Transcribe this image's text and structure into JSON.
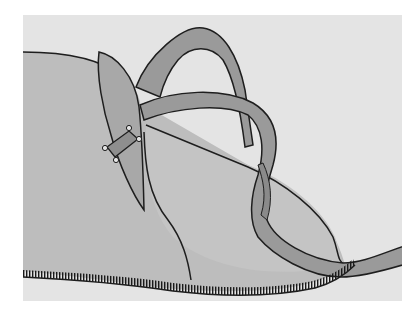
{
  "figure": {
    "colors": {
      "page_background": "#ffffff",
      "panel_background": "#e4e4e4",
      "garment_fill": "#bdbdbd",
      "cup_fill": "#c4c4c4",
      "strap_fill": "#9a9a9a",
      "slider_fill": "#8e8e8e",
      "outline": "#1e1e1e",
      "stitch": "#1a1a1a"
    },
    "parts": [
      {
        "name": "main-panel",
        "label": ""
      },
      {
        "name": "front-cup",
        "label": ""
      },
      {
        "name": "strap",
        "label": ""
      },
      {
        "name": "slider-ring",
        "label": ""
      },
      {
        "name": "stitched-hem",
        "label": ""
      }
    ]
  }
}
